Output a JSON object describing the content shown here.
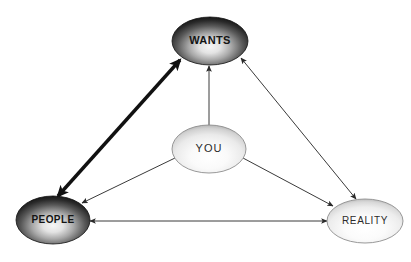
{
  "diagram": {
    "background_color": "#ffffff",
    "nodes": [
      {
        "id": "wants",
        "label": "WANTS",
        "shape": "ellipse",
        "cx": 210,
        "cy": 41,
        "rx": 38,
        "ry": 24,
        "fill_style": "dark-radial",
        "fill_dark": "#1c1c1c",
        "fill_light": "#f2f2f2",
        "text_color": "#141414",
        "font_size": 11,
        "bold": true
      },
      {
        "id": "you",
        "label": "YOU",
        "shape": "ellipse",
        "cx": 209,
        "cy": 149,
        "rx": 37,
        "ry": 24,
        "fill_style": "light-radial",
        "fill_dark": "#b9b9b9",
        "fill_light": "#ffffff",
        "text_color": "#2b2b2b",
        "font_size": 11,
        "bold": false
      },
      {
        "id": "people",
        "label": "PEOPLE",
        "shape": "ellipse",
        "cx": 53,
        "cy": 220,
        "rx": 37,
        "ry": 24,
        "fill_style": "dark-radial",
        "fill_dark": "#1c1c1c",
        "fill_light": "#f2f2f2",
        "text_color": "#141414",
        "font_size": 10,
        "bold": true
      },
      {
        "id": "reality",
        "label": "REALITY",
        "shape": "ellipse",
        "cx": 365,
        "cy": 221,
        "rx": 38,
        "ry": 22,
        "fill_style": "light-radial",
        "fill_dark": "#bdbdbd",
        "fill_light": "#ffffff",
        "text_color": "#2b2b2b",
        "font_size": 10,
        "bold": false
      }
    ],
    "edges": [
      {
        "id": "people-wants",
        "from": "people",
        "to": "wants",
        "arrows": "double",
        "weight": "thick",
        "stroke_width": 3.4,
        "color": "#111111",
        "x1": 58,
        "y1": 196,
        "x2": 180,
        "y2": 60
      },
      {
        "id": "wants-reality",
        "from": "wants",
        "to": "reality",
        "arrows": "double",
        "weight": "thin",
        "stroke_width": 1,
        "color": "#3a3a3a",
        "x1": 241,
        "y1": 58,
        "x2": 356,
        "y2": 199
      },
      {
        "id": "people-reality",
        "from": "reality",
        "to": "people",
        "arrows": "double",
        "weight": "thin",
        "stroke_width": 1,
        "color": "#3a3a3a",
        "x1": 90,
        "y1": 221,
        "x2": 327,
        "y2": 221
      },
      {
        "id": "you-wants",
        "from": "you",
        "to": "wants",
        "arrows": "single",
        "weight": "thin",
        "stroke_width": 1,
        "color": "#3a3a3a",
        "x1": 209,
        "y1": 125,
        "x2": 209,
        "y2": 66
      },
      {
        "id": "you-people",
        "from": "you",
        "to": "people",
        "arrows": "single",
        "weight": "thin",
        "stroke_width": 1,
        "color": "#3a3a3a",
        "x1": 175,
        "y1": 158,
        "x2": 82,
        "y2": 203
      },
      {
        "id": "you-reality",
        "from": "you",
        "to": "reality",
        "arrows": "single",
        "weight": "thin",
        "stroke_width": 1,
        "color": "#3a3a3a",
        "x1": 243,
        "y1": 158,
        "x2": 333,
        "y2": 206
      }
    ]
  }
}
